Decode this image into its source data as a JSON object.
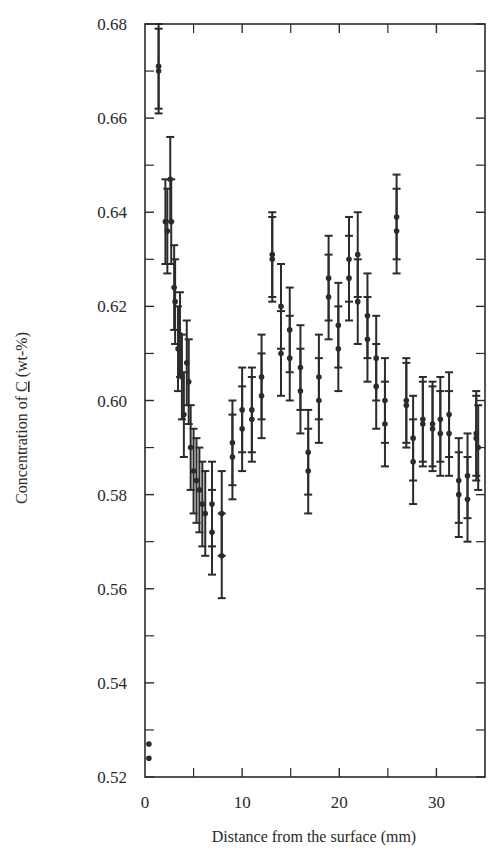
{
  "chart_data": {
    "type": "scatter",
    "title": "",
    "xlabel": "Distance from the surface (mm)",
    "ylabel": "Concentration of C (wt-%)",
    "ylabel_parts": {
      "prefix": "Concentration of ",
      "symbol": "C",
      "suffix": " (wt-%)"
    },
    "xlim": [
      0,
      35
    ],
    "ylim": [
      0.52,
      0.68
    ],
    "x_ticks": [
      0,
      10,
      20,
      30
    ],
    "x_minor_ticks": [
      5,
      15,
      25
    ],
    "y_ticks": [
      0.52,
      0.54,
      0.56,
      0.58,
      0.6,
      0.62,
      0.64,
      0.66,
      0.68
    ],
    "y_tick_labels": [
      "0.52",
      "0.54",
      "0.56",
      "0.58",
      "0.60",
      "0.62",
      "0.64",
      "0.66",
      "0.68"
    ],
    "y_minor_ticks": [
      0.53,
      0.55,
      0.57,
      0.59,
      0.61,
      0.63,
      0.65,
      0.67
    ],
    "grid": false,
    "legend": null,
    "error_bars": true,
    "series": [
      {
        "name": "C concentration",
        "points": [
          {
            "x": 0.4,
            "y": 0.527,
            "err": 0
          },
          {
            "x": 0.4,
            "y": 0.524,
            "err": 0
          },
          {
            "x": 1.4,
            "y": 0.671,
            "err": 0.009
          },
          {
            "x": 1.4,
            "y": 0.67,
            "err": 0.009
          },
          {
            "x": 2.1,
            "y": 0.638,
            "err": 0.009
          },
          {
            "x": 2.3,
            "y": 0.636,
            "err": 0.009
          },
          {
            "x": 2.6,
            "y": 0.647,
            "err": 0.009
          },
          {
            "x": 2.7,
            "y": 0.638,
            "err": 0.009
          },
          {
            "x": 3.0,
            "y": 0.624,
            "err": 0.009
          },
          {
            "x": 3.1,
            "y": 0.621,
            "err": 0.009
          },
          {
            "x": 3.4,
            "y": 0.611,
            "err": 0.009
          },
          {
            "x": 3.6,
            "y": 0.614,
            "err": 0.009
          },
          {
            "x": 3.8,
            "y": 0.605,
            "err": 0.009
          },
          {
            "x": 4.0,
            "y": 0.597,
            "err": 0.009
          },
          {
            "x": 4.3,
            "y": 0.608,
            "err": 0.009
          },
          {
            "x": 4.5,
            "y": 0.604,
            "err": 0.009
          },
          {
            "x": 4.7,
            "y": 0.59,
            "err": 0.009
          },
          {
            "x": 5.0,
            "y": 0.585,
            "err": 0.009
          },
          {
            "x": 5.3,
            "y": 0.583,
            "err": 0.009
          },
          {
            "x": 5.6,
            "y": 0.581,
            "err": 0.009
          },
          {
            "x": 5.9,
            "y": 0.578,
            "err": 0.009
          },
          {
            "x": 6.2,
            "y": 0.576,
            "err": 0.009
          },
          {
            "x": 6.9,
            "y": 0.578,
            "err": 0.009
          },
          {
            "x": 6.9,
            "y": 0.572,
            "err": 0.009
          },
          {
            "x": 7.9,
            "y": 0.576,
            "err": 0.009
          },
          {
            "x": 7.9,
            "y": 0.567,
            "err": 0.009
          },
          {
            "x": 9.0,
            "y": 0.591,
            "err": 0.009
          },
          {
            "x": 9.0,
            "y": 0.588,
            "err": 0.009
          },
          {
            "x": 10.0,
            "y": 0.598,
            "err": 0.009
          },
          {
            "x": 10.0,
            "y": 0.594,
            "err": 0.009
          },
          {
            "x": 11.0,
            "y": 0.598,
            "err": 0.009
          },
          {
            "x": 11.0,
            "y": 0.596,
            "err": 0.009
          },
          {
            "x": 12.0,
            "y": 0.605,
            "err": 0.009
          },
          {
            "x": 12.0,
            "y": 0.601,
            "err": 0.009
          },
          {
            "x": 13.1,
            "y": 0.631,
            "err": 0.009
          },
          {
            "x": 13.1,
            "y": 0.63,
            "err": 0.009
          },
          {
            "x": 14.0,
            "y": 0.62,
            "err": 0.009
          },
          {
            "x": 14.0,
            "y": 0.61,
            "err": 0.009
          },
          {
            "x": 14.9,
            "y": 0.615,
            "err": 0.009
          },
          {
            "x": 14.9,
            "y": 0.609,
            "err": 0.009
          },
          {
            "x": 16.0,
            "y": 0.607,
            "err": 0.009
          },
          {
            "x": 16.0,
            "y": 0.602,
            "err": 0.009
          },
          {
            "x": 16.8,
            "y": 0.589,
            "err": 0.009
          },
          {
            "x": 16.8,
            "y": 0.585,
            "err": 0.009
          },
          {
            "x": 17.9,
            "y": 0.605,
            "err": 0.009
          },
          {
            "x": 17.9,
            "y": 0.6,
            "err": 0.009
          },
          {
            "x": 18.9,
            "y": 0.626,
            "err": 0.009
          },
          {
            "x": 18.9,
            "y": 0.622,
            "err": 0.009
          },
          {
            "x": 19.9,
            "y": 0.616,
            "err": 0.009
          },
          {
            "x": 19.9,
            "y": 0.611,
            "err": 0.009
          },
          {
            "x": 21.0,
            "y": 0.63,
            "err": 0.009
          },
          {
            "x": 21.0,
            "y": 0.626,
            "err": 0.009
          },
          {
            "x": 21.9,
            "y": 0.631,
            "err": 0.009
          },
          {
            "x": 21.9,
            "y": 0.621,
            "err": 0.009
          },
          {
            "x": 22.9,
            "y": 0.618,
            "err": 0.009
          },
          {
            "x": 22.9,
            "y": 0.613,
            "err": 0.009
          },
          {
            "x": 23.8,
            "y": 0.609,
            "err": 0.009
          },
          {
            "x": 23.8,
            "y": 0.603,
            "err": 0.009
          },
          {
            "x": 24.7,
            "y": 0.6,
            "err": 0.009
          },
          {
            "x": 24.7,
            "y": 0.595,
            "err": 0.009
          },
          {
            "x": 25.9,
            "y": 0.639,
            "err": 0.009
          },
          {
            "x": 25.9,
            "y": 0.636,
            "err": 0.009
          },
          {
            "x": 26.9,
            "y": 0.6,
            "err": 0.009
          },
          {
            "x": 26.9,
            "y": 0.599,
            "err": 0.009
          },
          {
            "x": 27.6,
            "y": 0.592,
            "err": 0.009
          },
          {
            "x": 27.6,
            "y": 0.587,
            "err": 0.009
          },
          {
            "x": 28.6,
            "y": 0.596,
            "err": 0.009
          },
          {
            "x": 28.6,
            "y": 0.595,
            "err": 0.009
          },
          {
            "x": 29.6,
            "y": 0.595,
            "err": 0.009
          },
          {
            "x": 29.6,
            "y": 0.594,
            "err": 0.009
          },
          {
            "x": 30.4,
            "y": 0.596,
            "err": 0.009
          },
          {
            "x": 30.4,
            "y": 0.593,
            "err": 0.009
          },
          {
            "x": 31.3,
            "y": 0.597,
            "err": 0.009
          },
          {
            "x": 31.3,
            "y": 0.593,
            "err": 0.009
          },
          {
            "x": 32.3,
            "y": 0.583,
            "err": 0.009
          },
          {
            "x": 32.3,
            "y": 0.58,
            "err": 0.009
          },
          {
            "x": 33.2,
            "y": 0.584,
            "err": 0.009
          },
          {
            "x": 33.2,
            "y": 0.579,
            "err": 0.009
          },
          {
            "x": 34.1,
            "y": 0.593,
            "err": 0.009
          },
          {
            "x": 34.1,
            "y": 0.592,
            "err": 0.009
          },
          {
            "x": 34.3,
            "y": 0.59,
            "err": 0.009
          }
        ]
      }
    ]
  },
  "colors": {
    "ink": "#2b2b2b",
    "background": "#ffffff"
  }
}
